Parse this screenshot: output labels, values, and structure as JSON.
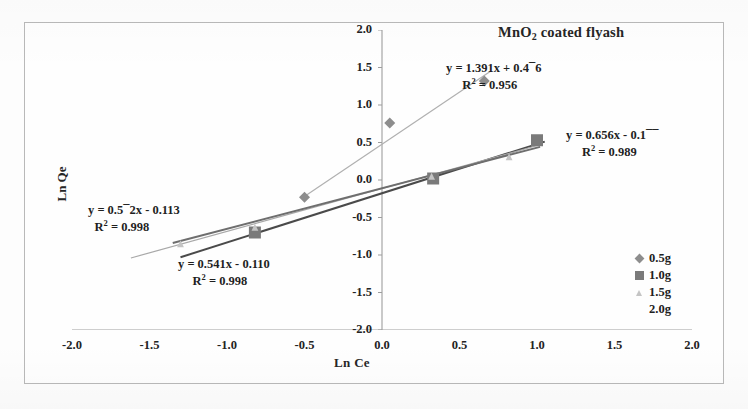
{
  "chart_data": {
    "type": "scatter",
    "title": "MnO2 coated flyash",
    "title_prefix": "MnO",
    "title_subscript": "2",
    "title_suffix": " coated flyash",
    "xlabel": "Ln Ce",
    "ylabel": "Ln Qe",
    "xlim": [
      -2.0,
      2.0
    ],
    "ylim": [
      -2.0,
      2.0
    ],
    "grid": false,
    "legend_position": "right-bottom",
    "x_ticks": [
      "-2.0",
      "-1.5",
      "-1.0",
      "-0.5",
      "0.0",
      "0.5",
      "1.0",
      "1.5",
      "2.0"
    ],
    "y_ticks": [
      "2.0",
      "1.5",
      "1.0",
      "0.5",
      "0.0",
      "-0.5",
      "-1.0",
      "-1.5",
      "-2.0"
    ],
    "x_tick_values": [
      -2.0,
      -1.5,
      -1.0,
      -0.5,
      0.0,
      0.5,
      1.0,
      1.5,
      2.0
    ],
    "y_tick_values": [
      2.0,
      1.5,
      1.0,
      0.5,
      0.0,
      -0.5,
      -1.0,
      -1.5,
      -2.0
    ],
    "series": [
      {
        "name": "0.5g",
        "marker": "diamond",
        "color": "#8d8d8d",
        "line_color": "#b0b0b0",
        "points": [
          {
            "x": -0.5,
            "y": -0.23
          },
          {
            "x": 0.05,
            "y": 0.76
          },
          {
            "x": 0.66,
            "y": 1.32
          }
        ],
        "fit_slope": 1.391,
        "fit_intercept": 0.476,
        "fit_x_start": -0.52,
        "fit_x_end": 0.7,
        "r_squared": 0.956
      },
      {
        "name": "1.0g",
        "marker": "square",
        "color": "#7a7a7a",
        "line_color": "#4a4a4a",
        "points": [
          {
            "x": -0.82,
            "y": -0.7
          },
          {
            "x": 0.33,
            "y": 0.02
          },
          {
            "x": 1.0,
            "y": 0.53
          }
        ],
        "fit_slope": 0.656,
        "fit_intercept": -0.177,
        "fit_x_start": -1.3,
        "fit_x_end": 1.05,
        "r_squared": 0.989
      },
      {
        "name": "1.5g",
        "marker": "triangle",
        "color": "#c4c4c4",
        "line_color": "#a8a8a8",
        "points": [
          {
            "x": -1.3,
            "y": -0.85
          },
          {
            "x": -0.82,
            "y": -0.63
          },
          {
            "x": 0.32,
            "y": 0.05
          },
          {
            "x": 0.82,
            "y": 0.31
          }
        ],
        "fit_slope": 0.572,
        "fit_intercept": -0.113,
        "fit_x_start": -1.62,
        "fit_x_end": 1.02,
        "r_squared": 0.998
      },
      {
        "name": "2.0g",
        "marker": "none",
        "color": "#9a9a9a",
        "line_color": "#6e6e6e",
        "points": [],
        "fit_slope": 0.541,
        "fit_intercept": -0.11,
        "fit_x_start": -1.35,
        "fit_x_end": 1.02,
        "r_squared": 0.998
      }
    ],
    "annotations": [
      {
        "id": "equation-0",
        "series": "0.5g",
        "equation": "y = 1.391x + 0.4⁾6",
        "equation_prefix": "y = 1.391x + 0.4",
        "equation_damaged_char": "¯",
        "equation_suffix": "6",
        "r2_label": "R",
        "r2_exp": "2",
        "r2_value": " = 0.956"
      },
      {
        "id": "equation-1",
        "series": "1.0g",
        "equation": "y = 0.656x - 0.1¯¯",
        "equation_prefix": "y = 0.656x - 0.1",
        "equation_damaged_char": "¯¯",
        "equation_suffix": "",
        "r2_label": "R",
        "r2_exp": "2",
        "r2_value": " = 0.989"
      },
      {
        "id": "equation-2",
        "series": "1.5g",
        "equation": "y = 0.5¯2x - 0.113",
        "equation_prefix": "y = 0.5",
        "equation_damaged_char": "¯",
        "equation_suffix": "2x - 0.113",
        "r2_label": "R",
        "r2_exp": "2",
        "r2_value": " = 0.998"
      },
      {
        "id": "equation-3",
        "series": "2.0g",
        "equation": "y = 0.541x - 0.110",
        "equation_prefix": "y = 0.541x - 0.110",
        "equation_damaged_char": "",
        "equation_suffix": "",
        "r2_label": "R",
        "r2_exp": "2",
        "r2_value": " = 0.998"
      }
    ]
  },
  "legend": {
    "items": [
      {
        "label": "0.5g",
        "marker": "diamond"
      },
      {
        "label": "1.0g",
        "marker": "square"
      },
      {
        "label": "1.5g",
        "marker": "triangle"
      },
      {
        "label": "2.0g",
        "marker": "none"
      }
    ]
  },
  "colors": {
    "axis": "#9d9d9d",
    "text": "#232323",
    "frame": "#b9b9b9",
    "background": "#fefefe"
  }
}
